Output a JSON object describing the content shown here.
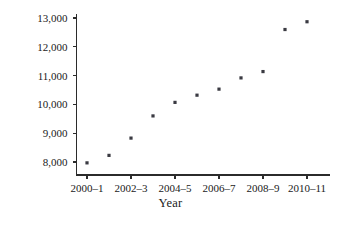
{
  "chart_data": {
    "type": "scatter",
    "title": "",
    "xlabel": "Year",
    "ylabel": "Dollars",
    "grid": false,
    "legend": null,
    "xlim": [
      2000,
      2010
    ],
    "ylim": [
      7600,
      13200
    ],
    "ytick_labels": [
      "13,000",
      "12,000",
      "11,000",
      "10,000",
      "9,000",
      "8,000"
    ],
    "ytick_values": [
      13000,
      12000,
      11000,
      10000,
      9000,
      8000
    ],
    "xtick_labels": [
      "2000–1",
      "2002–3",
      "2004–5",
      "2006–7",
      "2008–9",
      "2010–11"
    ],
    "xtick_values": [
      2000,
      2002,
      2004,
      2006,
      2008,
      2010
    ],
    "x": [
      2000,
      2001,
      2002,
      2003,
      2004,
      2005,
      2006,
      2007,
      2008,
      2009,
      2010
    ],
    "values": [
      7970,
      8230,
      8830,
      9600,
      10070,
      10320,
      10530,
      10920,
      11140,
      12600,
      12870
    ],
    "point_labels": [
      "2000–1",
      "2001–2",
      "2002–3",
      "2003–4",
      "2004–5",
      "2005–6",
      "2006–7",
      "2007–8",
      "2008–9",
      "2009–10",
      "2010–11"
    ],
    "marker": "square",
    "marker_color": "#3a3a42",
    "axis_color": "#2b2b2b",
    "background_color": "#ffffff"
  }
}
